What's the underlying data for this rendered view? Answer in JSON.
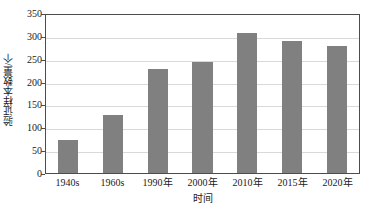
{
  "chart_data": {
    "type": "bar",
    "title": "",
    "xlabel": "时间",
    "ylabel": "验证样本数量/个",
    "categories": [
      "1940s",
      "1960s",
      "1990年",
      "2000年",
      "2010年",
      "2015年",
      "2020年"
    ],
    "values": [
      73,
      128,
      227,
      243,
      306,
      288,
      278
    ],
    "series": [
      {
        "name": "验证样本数量",
        "values": [
          73,
          128,
          227,
          243,
          306,
          288,
          278
        ]
      }
    ],
    "ylim": [
      0,
      350
    ],
    "yticks": [
      0,
      50,
      100,
      150,
      200,
      250,
      300,
      350
    ],
    "ytick_labels": [
      "0",
      "50",
      "100",
      "150",
      "200",
      "250",
      "300",
      "350"
    ],
    "grid": "horizontal",
    "legend": "none",
    "bar_color": "#808080",
    "gridline_color": "#D9D9D9",
    "axis_color": "#4C4C4C",
    "background_color": "#FFFFFF"
  }
}
